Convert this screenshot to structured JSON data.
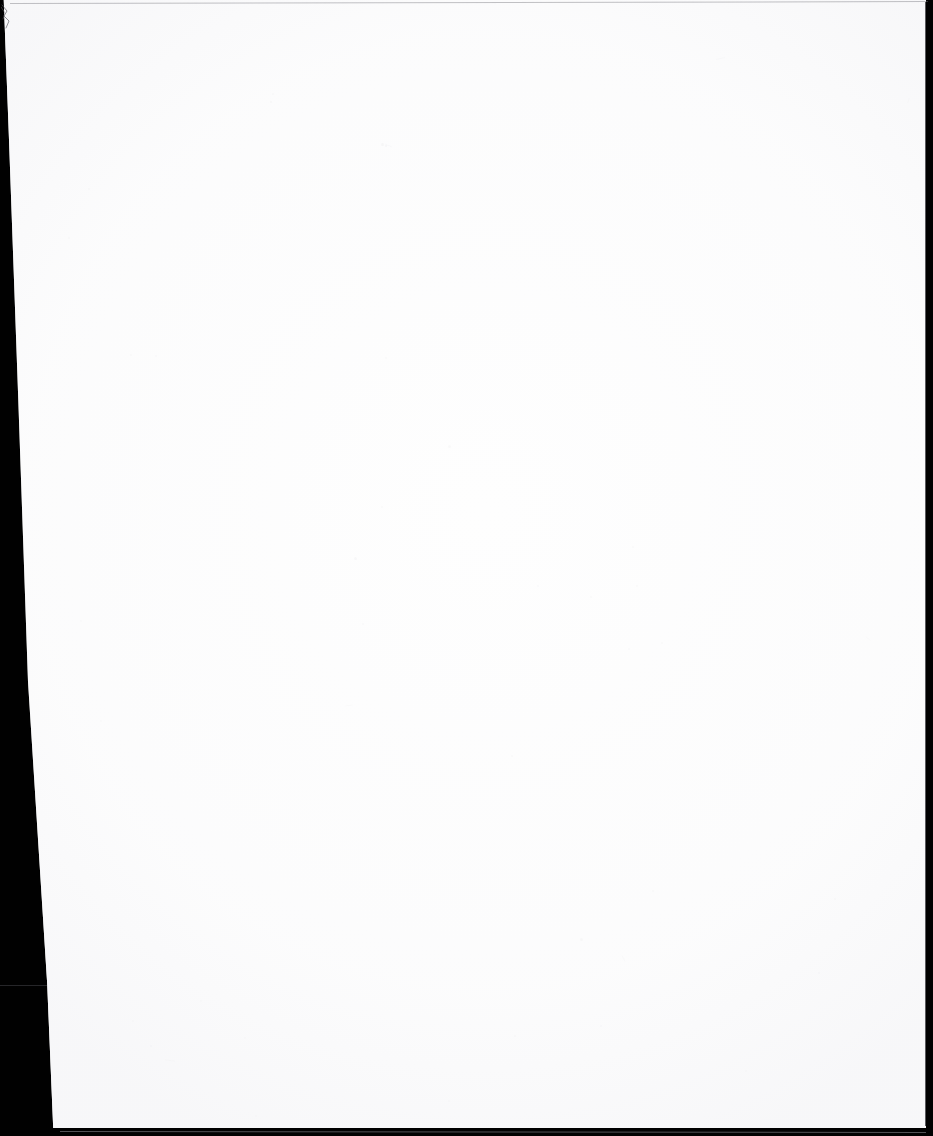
{
  "document": {
    "kind": "scanned-page-image",
    "page_content_text": "",
    "caption": "",
    "width_px": 933,
    "height_px": 1136
  },
  "page": {
    "body_text": "",
    "is_blank": true,
    "paper_color": "#fefefe",
    "background_color": "#010101"
  },
  "artifacts": {
    "left_gutter": {
      "name": "scanner-black-gutter",
      "color": "#010101",
      "width_top_px": 4,
      "width_bottom_px": 50
    },
    "top_edge": {
      "name": "page-top-edge-line",
      "color": "#78787e"
    },
    "right_edge": {
      "name": "page-right-edge-line",
      "color": "#37373c"
    },
    "bottom_edge": {
      "name": "page-bottom-edge-line",
      "color": "#96969c"
    },
    "corner_curl": {
      "name": "page-corner-curl",
      "color": "#5a5a60"
    },
    "gutter_seam": {
      "name": "gutter-horizontal-seam",
      "color": "#46464b"
    },
    "dust_color": "#a0a0a8"
  },
  "specks": [
    {
      "x": 381,
      "y": 143,
      "w": 3,
      "h": 3,
      "o": 0.22
    },
    {
      "x": 270,
      "y": 101,
      "w": 2,
      "h": 2,
      "o": 0.18
    },
    {
      "x": 272,
      "y": 93,
      "w": 2,
      "h": 2,
      "o": 0.16
    },
    {
      "x": 385,
      "y": 145,
      "w": 2,
      "h": 2,
      "o": 0.2
    },
    {
      "x": 88,
      "y": 188,
      "w": 2,
      "h": 2,
      "o": 0.15
    },
    {
      "x": 68,
      "y": 237,
      "w": 2,
      "h": 2,
      "o": 0.14
    },
    {
      "x": 130,
      "y": 354,
      "w": 2,
      "h": 2,
      "o": 0.16
    },
    {
      "x": 385,
      "y": 357,
      "w": 2,
      "h": 2,
      "o": 0.15
    },
    {
      "x": 155,
      "y": 355,
      "w": 2,
      "h": 2,
      "o": 0.13
    },
    {
      "x": 448,
      "y": 445,
      "w": 3,
      "h": 3,
      "o": 0.18
    },
    {
      "x": 381,
      "y": 506,
      "w": 2,
      "h": 2,
      "o": 0.15
    },
    {
      "x": 354,
      "y": 557,
      "w": 3,
      "h": 3,
      "o": 0.2
    },
    {
      "x": 632,
      "y": 546,
      "w": 2,
      "h": 2,
      "o": 0.16
    },
    {
      "x": 636,
      "y": 585,
      "w": 2,
      "h": 2,
      "o": 0.14
    },
    {
      "x": 537,
      "y": 585,
      "w": 2,
      "h": 2,
      "o": 0.13
    },
    {
      "x": 590,
      "y": 596,
      "w": 2,
      "h": 2,
      "o": 0.14
    },
    {
      "x": 362,
      "y": 623,
      "w": 2,
      "h": 2,
      "o": 0.15
    },
    {
      "x": 661,
      "y": 642,
      "w": 2,
      "h": 2,
      "o": 0.14
    },
    {
      "x": 628,
      "y": 648,
      "w": 2,
      "h": 2,
      "o": 0.13
    },
    {
      "x": 80,
      "y": 620,
      "w": 2,
      "h": 2,
      "o": 0.12
    },
    {
      "x": 511,
      "y": 755,
      "w": 2,
      "h": 2,
      "o": 0.15
    },
    {
      "x": 652,
      "y": 890,
      "w": 2,
      "h": 2,
      "o": 0.16
    },
    {
      "x": 580,
      "y": 938,
      "w": 3,
      "h": 3,
      "o": 0.18
    },
    {
      "x": 834,
      "y": 898,
      "w": 2,
      "h": 2,
      "o": 0.14
    },
    {
      "x": 818,
      "y": 972,
      "w": 2,
      "h": 2,
      "o": 0.13
    },
    {
      "x": 514,
      "y": 1035,
      "w": 2,
      "h": 2,
      "o": 0.14
    },
    {
      "x": 200,
      "y": 1000,
      "w": 2,
      "h": 2,
      "o": 0.12
    },
    {
      "x": 132,
      "y": 1020,
      "w": 2,
      "h": 2,
      "o": 0.12
    },
    {
      "x": 150,
      "y": 1045,
      "w": 2,
      "h": 2,
      "o": 0.13
    },
    {
      "x": 600,
      "y": 1025,
      "w": 2,
      "h": 2,
      "o": 0.13
    },
    {
      "x": 745,
      "y": 1070,
      "w": 2,
      "h": 2,
      "o": 0.12
    },
    {
      "x": 448,
      "y": 1100,
      "w": 2,
      "h": 2,
      "o": 0.12
    },
    {
      "x": 255,
      "y": 1115,
      "w": 2,
      "h": 2,
      "o": 0.12
    },
    {
      "x": 100,
      "y": 720,
      "w": 2,
      "h": 2,
      "o": 0.12
    },
    {
      "x": 244,
      "y": 1037,
      "w": 2,
      "h": 2,
      "o": 0.12
    }
  ],
  "scratches": [
    {
      "x": 716,
      "y": 58,
      "w": 9,
      "h": 1,
      "rot": -14,
      "o": 0.16
    },
    {
      "x": 385,
      "y": 145,
      "w": 7,
      "h": 1,
      "rot": 20,
      "o": 0.15
    },
    {
      "x": 865,
      "y": 638,
      "w": 6,
      "h": 1,
      "rot": 38,
      "o": 0.13
    },
    {
      "x": 345,
      "y": 705,
      "w": 8,
      "h": 1,
      "rot": -8,
      "o": 0.13
    },
    {
      "x": 620,
      "y": 958,
      "w": 7,
      "h": 1,
      "rot": 62,
      "o": 0.14
    },
    {
      "x": 165,
      "y": 1060,
      "w": 10,
      "h": 1,
      "rot": 5,
      "o": 0.12
    },
    {
      "x": 906,
      "y": 100,
      "w": 5,
      "h": 1,
      "rot": -70,
      "o": 0.12
    }
  ]
}
